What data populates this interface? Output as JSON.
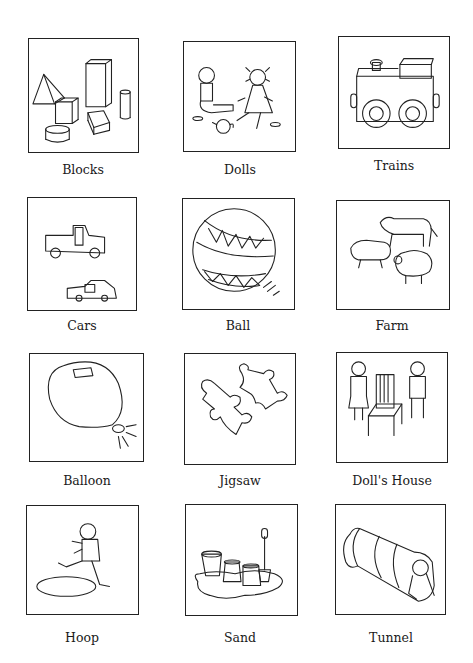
{
  "page": {
    "cards": [
      {
        "label": "Blocks",
        "icon": "blocks-icon"
      },
      {
        "label": "Dolls",
        "icon": "dolls-icon"
      },
      {
        "label": "Trains",
        "icon": "train-icon"
      },
      {
        "label": "Cars",
        "icon": "cars-icon"
      },
      {
        "label": "Ball",
        "icon": "ball-icon"
      },
      {
        "label": "Farm",
        "icon": "farm-animals-icon"
      },
      {
        "label": "Balloon",
        "icon": "balloon-icon"
      },
      {
        "label": "Jigsaw",
        "icon": "jigsaw-icon"
      },
      {
        "label": "Doll's House",
        "icon": "dolls-house-icon"
      },
      {
        "label": "Hoop",
        "icon": "hoop-icon"
      },
      {
        "label": "Sand",
        "icon": "sand-icon"
      },
      {
        "label": "Tunnel",
        "icon": "tunnel-icon"
      }
    ]
  }
}
